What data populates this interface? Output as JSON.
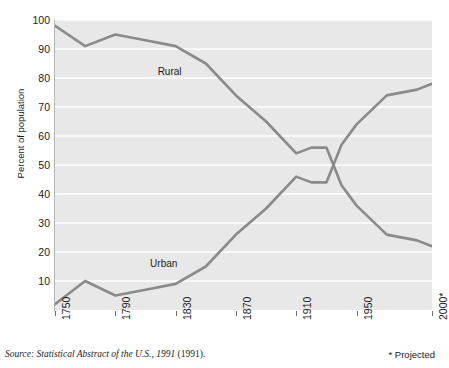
{
  "chart_data": {
    "type": "line",
    "title": "",
    "xlabel": "",
    "ylabel": "Percent of population",
    "xlim": [
      1750,
      2000
    ],
    "ylim": [
      0,
      100
    ],
    "grid": true,
    "gridlines_y": [
      10,
      20,
      30,
      40,
      50,
      60,
      70,
      80,
      90,
      100
    ],
    "y_ticks": [
      100,
      90,
      80,
      70,
      60,
      50,
      40,
      30,
      20,
      10
    ],
    "x_ticks": [
      1750,
      1790,
      1830,
      1870,
      1910,
      1950,
      2000
    ],
    "x_tick_labels": [
      "1750",
      "1790",
      "1830",
      "1870",
      "1910",
      "1950",
      "2000*"
    ],
    "legend_position": "inline",
    "line_color": "#8a8a8a",
    "panel_color": "#e8e8e8",
    "gridline_color": "#ffffff",
    "x": [
      1750,
      1770,
      1790,
      1810,
      1830,
      1850,
      1870,
      1890,
      1910,
      1920,
      1930,
      1940,
      1950,
      1970,
      1990,
      2000
    ],
    "series": [
      {
        "name": "Rural",
        "label": "Rural",
        "values": [
          98,
          91,
          95,
          93,
          91,
          85,
          74,
          65,
          54,
          56,
          56,
          43,
          36,
          26,
          24,
          22
        ]
      },
      {
        "name": "Urban",
        "label": "Urban",
        "values": [
          2,
          10,
          5,
          7,
          9,
          15,
          26,
          35,
          46,
          44,
          44,
          57,
          64,
          74,
          76,
          78
        ]
      }
    ],
    "annotations": [
      {
        "text": "Rural",
        "x": 1830,
        "y": 82
      },
      {
        "text": "Urban",
        "x": 1825,
        "y": 16
      }
    ]
  },
  "footer": {
    "source_italic": "Source: Statistical Abstract of the U.S., 1991",
    "source_roman": " (1991).",
    "projected_note": "* Projected"
  }
}
